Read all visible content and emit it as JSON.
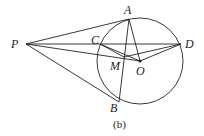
{
  "figure": {
    "caption": "(b)",
    "stroke_color": "#222222",
    "circle": {
      "center": "O",
      "cx": 140,
      "cy": 61,
      "r": 43
    },
    "points": {
      "P": {
        "x": 26,
        "y": 44,
        "label": "P",
        "lx": 11,
        "ly": 48
      },
      "A": {
        "x": 129,
        "y": 19,
        "label": "A",
        "lx": 124,
        "ly": 14
      },
      "C": {
        "x": 100,
        "y": 44,
        "label": "C",
        "lx": 91,
        "ly": 44
      },
      "D": {
        "x": 181,
        "y": 44,
        "label": "D",
        "lx": 185,
        "ly": 48
      },
      "M": {
        "x": 124,
        "y": 57,
        "label": "M",
        "lx": 110,
        "ly": 70
      },
      "O": {
        "x": 140,
        "y": 61,
        "label": "O",
        "lx": 136,
        "ly": 75
      },
      "B": {
        "x": 119,
        "y": 102,
        "label": "B",
        "lx": 110,
        "ly": 112
      }
    },
    "segments": [
      [
        "P",
        "A"
      ],
      [
        "P",
        "B"
      ],
      [
        "P",
        "D"
      ],
      [
        "P",
        "O"
      ],
      [
        "A",
        "B"
      ],
      [
        "A",
        "O"
      ],
      [
        "C",
        "O"
      ],
      [
        "C",
        "M"
      ],
      [
        "M",
        "D"
      ],
      [
        "O",
        "D"
      ]
    ]
  }
}
